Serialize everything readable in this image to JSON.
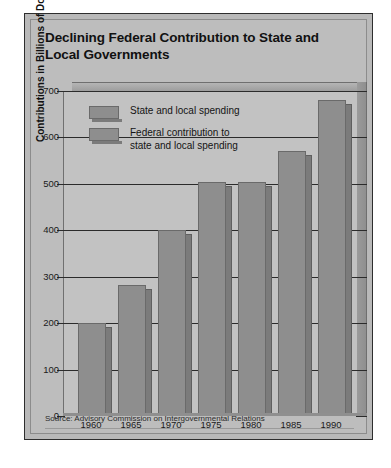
{
  "figure": {
    "title": "Declining Federal Contribution to State and Local Governments",
    "source": "Source: Advisory Commission on Intergovernmental Relations",
    "colors": {
      "page_background": "#ffffff",
      "figure_background": "#bdbdbd",
      "plot_background": "#c2c2c2",
      "bar_fill": "#8e8e8e",
      "bar_side": "#7b7b7b",
      "gridline": "#2b2b2b",
      "text": "#111111"
    }
  },
  "chart_data": {
    "type": "bar",
    "title": "Declining Federal Contribution to State and Local Governments",
    "xlabel": "",
    "ylabel": "Contributions in Billions of Dollars",
    "categories": [
      "1960",
      "1965",
      "1970",
      "1975",
      "1980",
      "1985",
      "1990"
    ],
    "values": [
      200,
      283,
      400,
      505,
      505,
      570,
      680
    ],
    "series": [
      {
        "name": "State and local spending",
        "values": [
          200,
          283,
          400,
          505,
          505,
          570,
          680
        ]
      }
    ],
    "ylim": [
      0,
      700
    ],
    "yticks": [
      0,
      100,
      200,
      300,
      400,
      500,
      600,
      700
    ],
    "ytick_labels": [
      "0",
      "100",
      "200",
      "300",
      "400",
      "500",
      "600",
      "700"
    ],
    "grid": true,
    "legend_position": "upper-left-inside",
    "legend": [
      "State and local spending",
      "Federal contribution to\nstate and local spending"
    ],
    "annotations": [
      "Source: Advisory Commission on Intergovernmental Relations"
    ]
  }
}
